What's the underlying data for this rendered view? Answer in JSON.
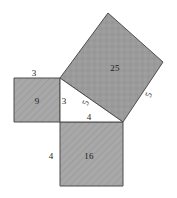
{
  "diagram": {
    "type": "geometry-diagram",
    "background_color": "#ffffff",
    "stroke_color": "#4d4d4d",
    "fill_hatched_color": "#a8a8a8",
    "fill_solid_color": "#9b9b9b",
    "text_color": "#1a1a1a",
    "triangle": {
      "name": "right-triangle",
      "legs": [
        3,
        4
      ],
      "hypotenuse": 5,
      "vertices": [
        {
          "name": "right-angle-vertex",
          "x": 60,
          "y": 122
        },
        {
          "name": "top-vertex",
          "x": 60,
          "y": 78
        },
        {
          "name": "right-vertex",
          "x": 123,
          "y": 122
        }
      ]
    },
    "squares": [
      {
        "name": "square-on-leg-a",
        "area_label": "9",
        "side_label": "3",
        "fill": "hatched",
        "points": "14,78 60,78 60,122 14,122"
      },
      {
        "name": "square-on-leg-b",
        "area_label": "16",
        "side_label": "4",
        "fill": "hatched",
        "points": "60,122 123,122 123,186 60,186"
      },
      {
        "name": "square-on-hypotenuse",
        "area_label": "25",
        "side_label": "5",
        "fill": "solid",
        "points": "60,78 108,13 163,62 123,122"
      }
    ],
    "labels": [
      {
        "name": "label-side-a-top",
        "text": "3",
        "x": 34,
        "y": 73,
        "rotate": 0
      },
      {
        "name": "label-area-9",
        "text": "9",
        "x": 37,
        "y": 101,
        "rotate": 0
      },
      {
        "name": "label-side-a-inner",
        "text": "3",
        "x": 64,
        "y": 101,
        "rotate": 0
      },
      {
        "name": "label-side-c-inner",
        "text": "5",
        "x": 86,
        "y": 103,
        "rotate": -68
      },
      {
        "name": "label-side-b-inner",
        "text": "4",
        "x": 89,
        "y": 117,
        "rotate": 0
      },
      {
        "name": "label-side-b-left",
        "text": "4",
        "x": 51,
        "y": 156,
        "rotate": 0
      },
      {
        "name": "label-area-16",
        "text": "16",
        "x": 89,
        "y": 156,
        "rotate": 0
      },
      {
        "name": "label-area-25",
        "text": "25",
        "x": 115,
        "y": 68,
        "rotate": 0
      },
      {
        "name": "label-side-c-outer",
        "text": "5",
        "x": 149,
        "y": 95,
        "rotate": -68
      }
    ]
  }
}
